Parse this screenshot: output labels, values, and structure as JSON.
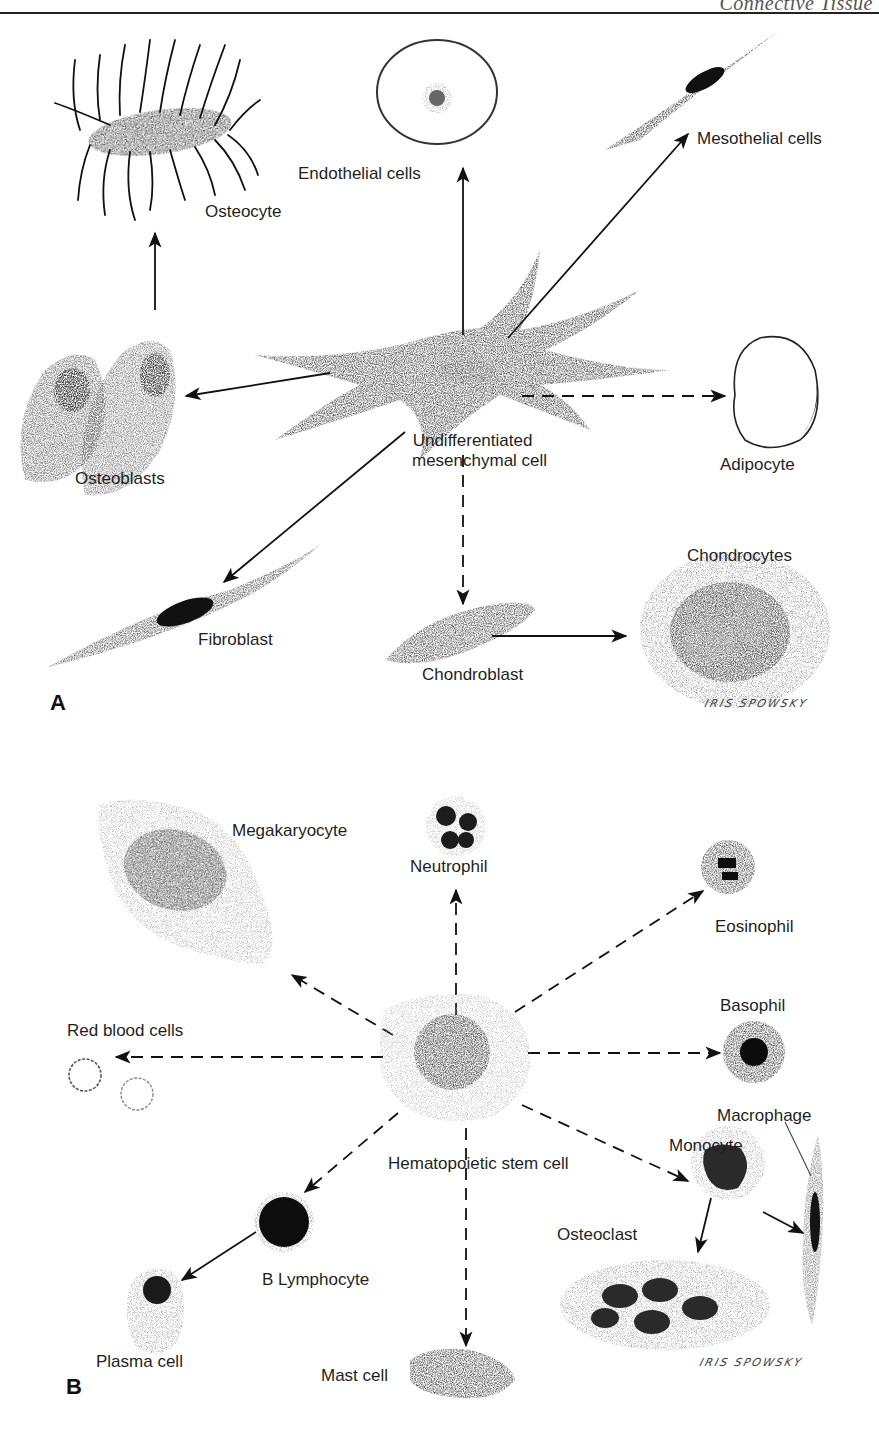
{
  "page": {
    "running_head": "Connective Tissue",
    "figure_type": "cell differentiation diagram"
  },
  "panel_a": {
    "letter": "A",
    "source_cell": "Undifferentiated mesenchymal cell",
    "source_label_line1": "Undifferentiated",
    "source_label_line2": "mesenchymal cell",
    "targets": [
      {
        "name": "Osteocyte",
        "arrow": "solid",
        "via": "Osteoblasts"
      },
      {
        "name": "Endothelial cells",
        "arrow": "solid"
      },
      {
        "name": "Mesothelial cells",
        "arrow": "solid"
      },
      {
        "name": "Osteoblasts",
        "arrow": "solid"
      },
      {
        "name": "Adipocyte",
        "arrow": "dashed"
      },
      {
        "name": "Fibroblast",
        "arrow": "solid"
      },
      {
        "name": "Chondroblast",
        "arrow": "dashed"
      },
      {
        "name": "Chondrocytes",
        "arrow": "solid",
        "via": "Chondroblast"
      }
    ],
    "labels": {
      "osteocyte": "Osteocyte",
      "endothelial": "Endothelial cells",
      "mesothelial": "Mesothelial cells",
      "osteoblasts": "Osteoblasts",
      "adipocyte": "Adipocyte",
      "fibroblast": "Fibroblast",
      "chondroblast": "Chondroblast",
      "chondrocytes": "Chondrocytes"
    },
    "signature": "IRIS SPOWSKY"
  },
  "panel_b": {
    "letter": "B",
    "source_cell": "Hematopoietic stem cell",
    "targets": [
      {
        "name": "Megakaryocyte",
        "arrow": "dashed"
      },
      {
        "name": "Neutrophil",
        "arrow": "dashed"
      },
      {
        "name": "Eosinophil",
        "arrow": "dashed"
      },
      {
        "name": "Basophil",
        "arrow": "dashed"
      },
      {
        "name": "Red blood cells",
        "arrow": "dashed"
      },
      {
        "name": "Monocyte",
        "arrow": "dashed"
      },
      {
        "name": "Macrophage",
        "arrow": "solid",
        "via": "Monocyte"
      },
      {
        "name": "Osteoclast",
        "arrow": "solid",
        "via": "Monocyte"
      },
      {
        "name": "B Lymphocyte",
        "arrow": "dashed"
      },
      {
        "name": "Plasma cell",
        "arrow": "solid",
        "via": "B Lymphocyte"
      },
      {
        "name": "Mast cell",
        "arrow": "dashed"
      }
    ],
    "labels": {
      "source": "Hematopoietic stem cell",
      "megakaryocyte": "Megakaryocyte",
      "neutrophil": "Neutrophil",
      "eosinophil": "Eosinophil",
      "basophil": "Basophil",
      "rbc": "Red blood cells",
      "monocyte": "Monocyte",
      "macrophage": "Macrophage",
      "osteoclast": "Osteoclast",
      "b_lymphocyte": "B Lymphocyte",
      "plasma": "Plasma cell",
      "mast": "Mast cell"
    },
    "signature": "IRIS SPOWSKY"
  }
}
